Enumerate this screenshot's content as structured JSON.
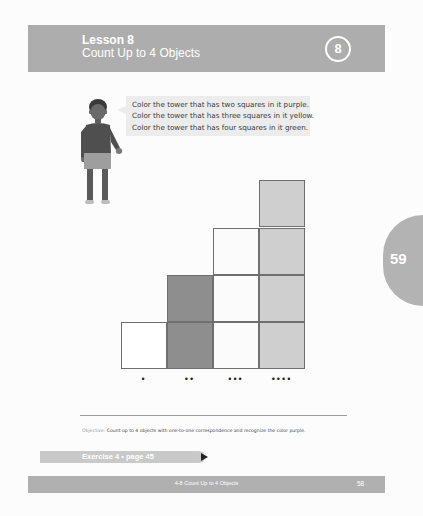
{
  "header": {
    "lesson_label": "Lesson 8",
    "lesson_title": "Count Up to 4 Objects",
    "lesson_number_badge": "8",
    "background_color": "#adadad"
  },
  "side_tab": {
    "page_number": "59"
  },
  "instructions": {
    "lines": [
      "Color the tower that has two squares in it purple.",
      "Color the tower that has three squares in it yellow.",
      "Color the tower that has four squares in it green."
    ]
  },
  "towers": [
    {
      "squares": 1,
      "dots": "•",
      "fill": "#ffffff"
    },
    {
      "squares": 2,
      "dots": "••",
      "fill": "#8e8e8e"
    },
    {
      "squares": 3,
      "dots": "•••",
      "fill": "#fbfbfb"
    },
    {
      "squares": 4,
      "dots": "••••",
      "fill": "#cfcfcf"
    }
  ],
  "objective": {
    "label": "Objective:",
    "text": "Count up to 4 objects with one-to-one correspondence and recognize the color purple."
  },
  "exercise": {
    "label": "Exercise 4 • page 45"
  },
  "footer": {
    "title": "4-8  Count Up to 4 Objects",
    "page_number": "58"
  }
}
